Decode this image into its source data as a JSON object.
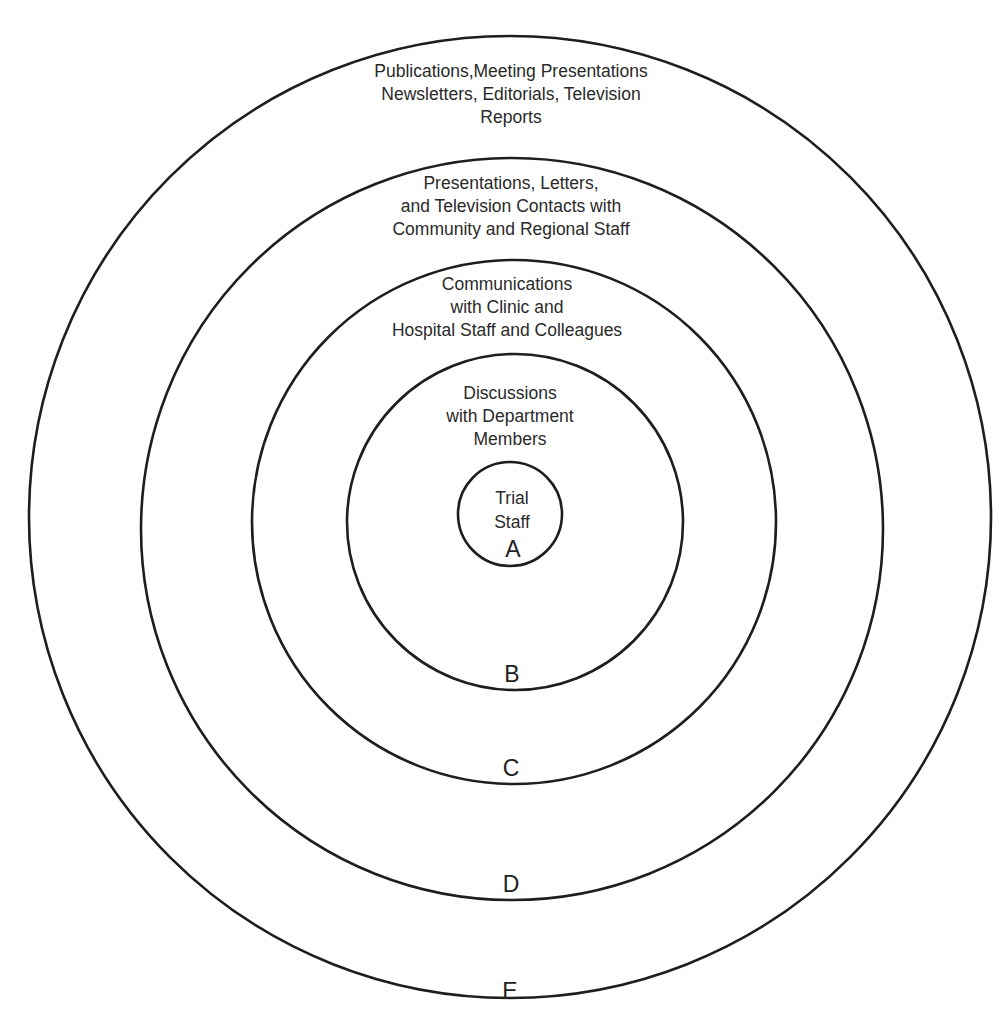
{
  "diagram": {
    "type": "concentric-circles",
    "stroke_color": "#1e1e1e",
    "rings": [
      {
        "id": "A",
        "letter": "A",
        "lines": [
          "Trial",
          "Staff"
        ]
      },
      {
        "id": "B",
        "letter": "B",
        "lines": [
          "Discussions",
          "with Department",
          "Members"
        ]
      },
      {
        "id": "C",
        "letter": "C",
        "lines": [
          "Communications",
          "with Clinic and",
          "Hospital Staff and Colleagues"
        ]
      },
      {
        "id": "D",
        "letter": "D",
        "lines": [
          "Presentations, Letters,",
          "and Television Contacts with",
          "Community and Regional Staff"
        ]
      },
      {
        "id": "E",
        "letter": "E",
        "lines": [
          "Publications,Meeting Presentations",
          "Newsletters, Editorials, Television",
          "Reports"
        ]
      }
    ]
  }
}
